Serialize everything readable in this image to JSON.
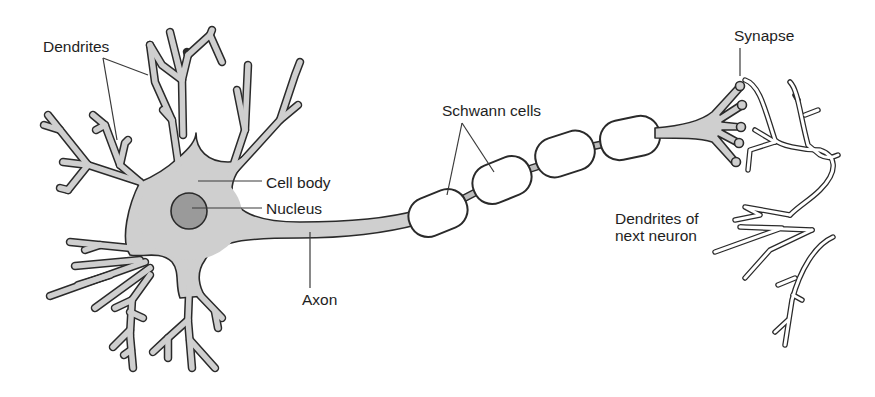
{
  "labels": {
    "dendrites": "Dendrites",
    "cell_body": "Cell body",
    "nucleus": "Nucleus",
    "axon": "Axon",
    "schwann_cells": "Schwann cells",
    "synapse": "Synapse",
    "dendrites_next_line1": "Dendrites of",
    "dendrites_next_line2": "next neuron"
  },
  "colors": {
    "cytoplasm": "#cfcfcf",
    "nucleus": "#9a9a9a",
    "outline": "#2a2a2a",
    "schwann_fill": "#ffffff",
    "background": "#ffffff"
  },
  "parts": [
    "dendrites",
    "cell body",
    "nucleus",
    "axon",
    "schwann cells",
    "synapse",
    "dendrites of next neuron"
  ]
}
